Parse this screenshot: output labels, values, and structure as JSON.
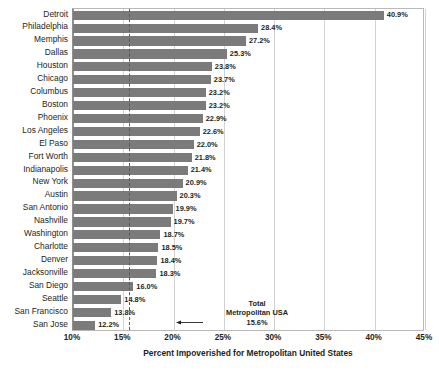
{
  "chart_data": {
    "type": "bar",
    "orientation": "horizontal",
    "title": "",
    "xlabel": "Percent Impoverished for Metropolitan United States",
    "ylabel": "",
    "xlim": [
      10,
      45
    ],
    "xtick_labels": [
      "10%",
      "15%",
      "20%",
      "25%",
      "30%",
      "35%",
      "40%",
      "45%"
    ],
    "xticks": [
      10,
      15,
      20,
      25,
      30,
      35,
      40,
      45
    ],
    "grid": true,
    "legend": false,
    "value_label_suffix": "%",
    "bar_color": "#7b7b7b",
    "categories": [
      "Detroit",
      "Philadelphia",
      "Memphis",
      "Dallas",
      "Houston",
      "Chicago",
      "Columbus",
      "Boston",
      "Phoenix",
      "Los Angeles",
      "El Paso",
      "Fort Worth",
      "Indianapolis",
      "New York",
      "Austin",
      "San Antonio",
      "Nashville",
      "Washington",
      "Charlotte",
      "Denver",
      "Jacksonville",
      "San Diego",
      "Seattle",
      "San Francisco",
      "San Jose"
    ],
    "values": [
      40.9,
      28.4,
      27.2,
      25.3,
      23.8,
      23.7,
      23.2,
      23.2,
      22.9,
      22.6,
      22.0,
      21.8,
      21.4,
      20.9,
      20.3,
      19.9,
      19.7,
      18.7,
      18.5,
      18.4,
      18.3,
      16.0,
      14.8,
      13.8,
      12.2
    ],
    "value_labels": [
      "40.9%",
      "28.4%",
      "27.2%",
      "25.3%",
      "23.8%",
      "23.7%",
      "23.2%",
      "23.2%",
      "22.9%",
      "22.6%",
      "22.0%",
      "21.8%",
      "21.4%",
      "20.9%",
      "20.3%",
      "19.9%",
      "19.7%",
      "18.7%",
      "18.5%",
      "18.4%",
      "18.3%",
      "16.0%",
      "14.8%",
      "13.8%",
      "12.2%"
    ],
    "reference_line": {
      "value": 15.6,
      "style": "dashed",
      "color": "#5a5a5a",
      "annotation_line1": "Total",
      "annotation_line2": "Metropolitan USA",
      "annotation_line3": "15.6%"
    }
  }
}
